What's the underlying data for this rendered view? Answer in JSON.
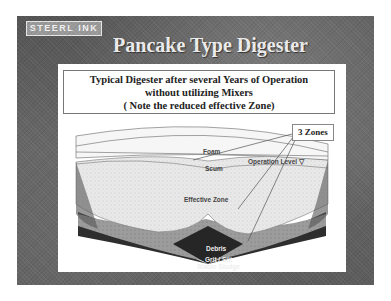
{
  "slide": {
    "logo": "STEERL INK",
    "title": "Pancake Type Digester"
  },
  "caption": {
    "line1": "Typical Digester after several Years of Operation",
    "line2": "without utilizing Mixers",
    "line3": "( Note the reduced effective Zone)"
  },
  "callout": {
    "label": "3 Zones"
  },
  "diagram": {
    "labels": {
      "foam": "Foam",
      "scum": "Scum",
      "operation_level": "Operation Level ▽",
      "effective_zone": "Effective Zone",
      "debris": "Debris",
      "grit_line1": "Grit / Silt",
      "grit_line2": "Stable Sludge"
    }
  },
  "colors": {
    "background": "#5e5e5e",
    "panel": "#ffffff",
    "sludge": "#2a2a2a"
  }
}
